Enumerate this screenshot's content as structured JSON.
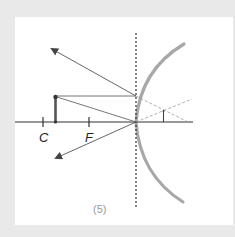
{
  "figure": {
    "type": "convex-mirror-ray-diagram",
    "caption": "(5)",
    "labels": {
      "center_of_curvature": "C",
      "focal_point": "F"
    },
    "colors": {
      "background": "#e9e9e9",
      "panel": "#ffffff",
      "ray": "#555555",
      "mirror": "#a8a8a8",
      "axis": "#333333",
      "dashed": "#999999",
      "object": "#444444"
    },
    "elements": {
      "principal_axis": {
        "x1": 15,
        "y1": 122,
        "x2": 193,
        "y2": 122
      },
      "mirror_plane_dashed": {
        "x": 136,
        "y1": 33,
        "y2": 209
      },
      "mirror_arc": {
        "top": [
          184,
          44
        ],
        "vertex": [
          136,
          122
        ],
        "bottom": [
          183,
          202
        ]
      },
      "object": {
        "x": 55,
        "base_y": 122,
        "top_y": 96
      },
      "image": {
        "x": 163,
        "base_y": 122,
        "top_y": 110
      },
      "tick_C": {
        "x": 43
      },
      "tick_F": {
        "x": 89
      }
    }
  }
}
